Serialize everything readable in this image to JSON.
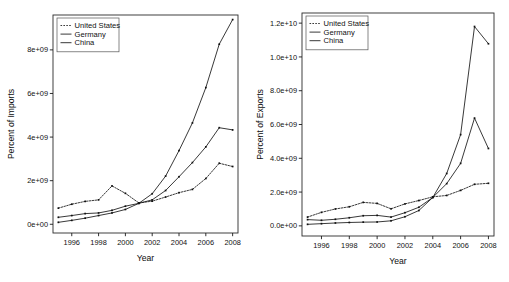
{
  "figure": {
    "title": "",
    "panel_count": 2
  },
  "chart_data": [
    {
      "type": "line",
      "panel": "left",
      "title": "",
      "xlabel": "Year",
      "ylabel": "Percent of Imports",
      "xlim": [
        1994.6,
        2008.4
      ],
      "ylim": [
        -400000000,
        9600000000
      ],
      "grid": false,
      "legend_position": "top-left",
      "xticks": [
        1996,
        1998,
        2000,
        2002,
        2004,
        2006,
        2008
      ],
      "xticklabels": [
        "1996",
        "1998",
        "2000",
        "2002",
        "2004",
        "2006",
        "2008"
      ],
      "yticks": [
        0,
        2000000000,
        4000000000,
        6000000000,
        8000000000
      ],
      "yticklabels": [
        "0e+00",
        "2e+09",
        "4e+09",
        "6e+09",
        "8e+09"
      ],
      "x": [
        1995,
        1996,
        1997,
        1998,
        1999,
        2000,
        2001,
        2002,
        2003,
        2004,
        2005,
        2006,
        2007,
        2008
      ],
      "series": [
        {
          "name": "United States",
          "style": "dashed",
          "values": [
            740000000,
            920000000,
            1050000000,
            1120000000,
            1760000000,
            1420000000,
            980000000,
            1060000000,
            1250000000,
            1450000000,
            1600000000,
            2100000000,
            2800000000,
            2650000000
          ]
        },
        {
          "name": "Germany",
          "style": "solid",
          "values": [
            320000000,
            400000000,
            490000000,
            520000000,
            640000000,
            830000000,
            960000000,
            1120000000,
            1550000000,
            2180000000,
            2830000000,
            3550000000,
            4430000000,
            4330000000
          ]
        },
        {
          "name": "China",
          "style": "solid",
          "values": [
            90000000,
            180000000,
            280000000,
            400000000,
            520000000,
            680000000,
            960000000,
            1400000000,
            2210000000,
            3380000000,
            4650000000,
            6270000000,
            8260000000,
            9390000000
          ]
        }
      ]
    },
    {
      "type": "line",
      "panel": "right",
      "title": "",
      "xlabel": "Year",
      "ylabel": "Percent of Exports",
      "xlim": [
        1994.6,
        2008.4
      ],
      "ylim": [
        -600000000,
        12600000000
      ],
      "grid": false,
      "legend_position": "top-left",
      "xticks": [
        1996,
        1998,
        2000,
        2002,
        2004,
        2006,
        2008
      ],
      "xticklabels": [
        "1996",
        "1998",
        "2000",
        "2002",
        "2004",
        "2006",
        "2008"
      ],
      "yticks": [
        0,
        2000000000,
        4000000000,
        6000000000,
        8000000000,
        10000000000,
        12000000000
      ],
      "yticklabels": [
        "0.0e+00",
        "2.0e+09",
        "4.0e+09",
        "6.0e+09",
        "8.0e+09",
        "1.0e+10",
        "1.2e+10"
      ],
      "x": [
        1995,
        1996,
        1997,
        1998,
        1999,
        2000,
        2001,
        2002,
        2003,
        2004,
        2005,
        2006,
        2007,
        2008
      ],
      "series": [
        {
          "name": "United States",
          "style": "dashed",
          "values": [
            520000000,
            800000000,
            1000000000,
            1130000000,
            1390000000,
            1330000000,
            1010000000,
            1300000000,
            1500000000,
            1720000000,
            1800000000,
            2100000000,
            2460000000,
            2520000000
          ]
        },
        {
          "name": "Germany",
          "style": "solid",
          "values": [
            370000000,
            330000000,
            390000000,
            480000000,
            600000000,
            620000000,
            520000000,
            780000000,
            1100000000,
            1680000000,
            2500000000,
            3700000000,
            6380000000,
            4580000000
          ]
        },
        {
          "name": "China",
          "style": "solid",
          "values": [
            90000000,
            130000000,
            170000000,
            200000000,
            220000000,
            230000000,
            300000000,
            540000000,
            910000000,
            1680000000,
            3100000000,
            5400000000,
            11800000000,
            10780000000
          ]
        }
      ]
    }
  ]
}
